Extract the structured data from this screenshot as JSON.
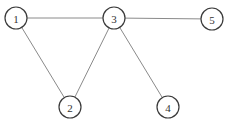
{
  "graph": {
    "nodes": [
      {
        "id": "1",
        "label": "1",
        "x": 16,
        "y": 18
      },
      {
        "id": "2",
        "label": "2",
        "x": 70,
        "y": 107
      },
      {
        "id": "3",
        "label": "3",
        "x": 114,
        "y": 18
      },
      {
        "id": "4",
        "label": "4",
        "x": 168,
        "y": 107
      },
      {
        "id": "5",
        "label": "5",
        "x": 212,
        "y": 19
      }
    ],
    "edges": [
      {
        "from": "1",
        "to": "3"
      },
      {
        "from": "1",
        "to": "2"
      },
      {
        "from": "2",
        "to": "3"
      },
      {
        "from": "3",
        "to": "4"
      },
      {
        "from": "3",
        "to": "5"
      }
    ],
    "node_radius": 11,
    "colors": {
      "edge": "#8a8a8a",
      "node_stroke": "#3a3a3a",
      "node_fill": "#ffffff",
      "label": "#333333"
    }
  }
}
